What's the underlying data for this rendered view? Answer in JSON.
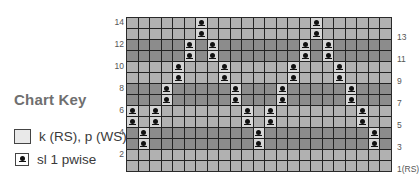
{
  "chart_key": {
    "title": "Chart Key",
    "items": [
      {
        "symbol": "empty-square",
        "label": "k (RS), p (WS)"
      },
      {
        "symbol": "slip-dot",
        "label": "sl 1 pwise"
      }
    ]
  },
  "chart": {
    "columns": 23,
    "rows": 14,
    "row_labels_left": [
      "14",
      "12",
      "10",
      "8",
      "6",
      "4",
      "2"
    ],
    "row_labels_right": [
      "13",
      "11",
      "9",
      "7",
      "5",
      "3",
      "1(RS)"
    ],
    "colors": {
      "light_row": "#b1b1b1",
      "dark_row": "#8c8c8c",
      "slip_cell": "#d6d6d6",
      "grid_line": "#222222"
    },
    "row_shading": {
      "14": "light",
      "13": "light",
      "12": "dark",
      "11": "dark",
      "10": "light",
      "9": "light",
      "8": "dark",
      "7": "dark",
      "6": "light",
      "5": "light",
      "4": "dark",
      "3": "dark",
      "2": "light",
      "1": "light"
    },
    "slip_stitches": {
      "14": [
        6,
        16
      ],
      "13": [
        6,
        16
      ],
      "12": [
        5,
        7,
        15,
        17
      ],
      "11": [
        5,
        7,
        15,
        17
      ],
      "10": [
        4,
        8,
        14,
        18
      ],
      "9": [
        4,
        8,
        14,
        18
      ],
      "8": [
        3,
        9,
        13,
        19
      ],
      "7": [
        3,
        9,
        13,
        19
      ],
      "6": [
        0,
        2,
        10,
        12,
        20
      ],
      "5": [
        0,
        2,
        10,
        12,
        20
      ],
      "4": [
        1,
        11,
        21
      ],
      "3": [
        1,
        11,
        21
      ],
      "2": [],
      "1": []
    }
  }
}
